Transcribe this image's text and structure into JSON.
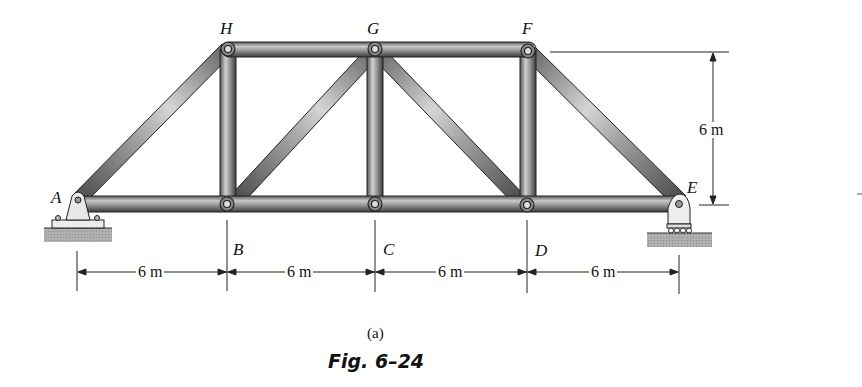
{
  "figure": {
    "subcaption": "(a)",
    "caption": "Fig. 6–24"
  },
  "joints": {
    "A": "A",
    "B": "B",
    "C": "C",
    "D": "D",
    "E": "E",
    "F": "F",
    "G": "G",
    "H": "H"
  },
  "dimensions": {
    "height": "6 m",
    "spans": [
      "6 m",
      "6 m",
      "6 m",
      "6 m"
    ]
  },
  "members": [
    "AB",
    "BC",
    "CD",
    "DE",
    "HG",
    "GF",
    "AH",
    "HB",
    "BG",
    "GC",
    "GD",
    "FD",
    "FE"
  ],
  "supports": {
    "left": "pin-support-A",
    "right": "roller-support-E"
  },
  "colors": {
    "member_dark": "#3a3a3a",
    "member_mid": "#8c8c8c",
    "member_light": "#e6e6e6",
    "ground": "#a8a8a8"
  }
}
